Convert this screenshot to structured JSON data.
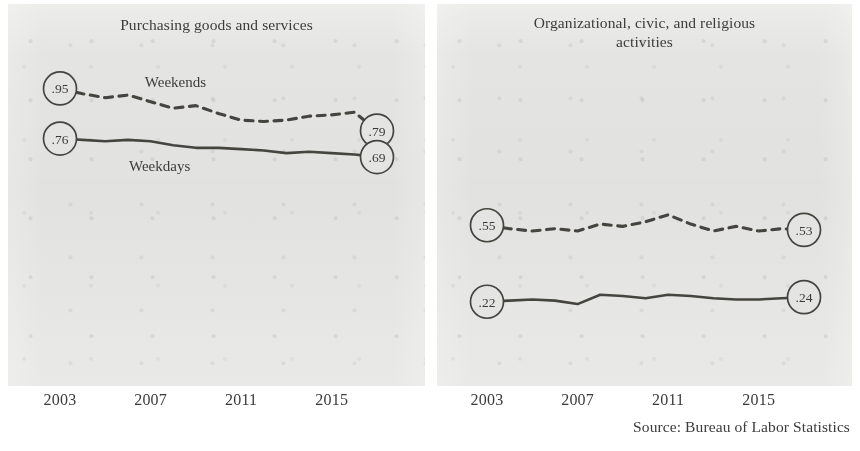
{
  "figure": {
    "width": 860,
    "height": 451,
    "background": "#ffffff",
    "panel_background": "#e4e4e2",
    "ink_color": "#45443f",
    "source_note": "Source: Bureau of Labor Statistics"
  },
  "panels": [
    {
      "id": "purchasing",
      "title": "Purchasing goods and services",
      "tick_labels": [
        "2003",
        "2007",
        "2011",
        "2015"
      ],
      "tick_years": [
        2003,
        2007,
        2011,
        2015
      ],
      "series_labels": [
        {
          "text": "Weekends",
          "year": 2008.1,
          "value": 0.955
        },
        {
          "text": "Weekdays",
          "year": 2007.4,
          "value": 0.638
        }
      ]
    },
    {
      "id": "organizational",
      "title": "Organizational, civic, and religious\nactivities",
      "tick_labels": [
        "2003",
        "2007",
        "2011",
        "2015"
      ],
      "tick_years": [
        2003,
        2007,
        2011,
        2015
      ],
      "series_labels": []
    }
  ],
  "chart_data": [
    {
      "type": "line",
      "title": "Purchasing goods and services",
      "xlabel": "",
      "ylabel": "Hours per day",
      "xlim": [
        2003,
        2017
      ],
      "ylim": [
        0.55,
        1.02
      ],
      "grid": false,
      "legend": "inline-annotations",
      "x": [
        2003,
        2004,
        2005,
        2006,
        2007,
        2008,
        2009,
        2010,
        2011,
        2012,
        2013,
        2014,
        2015,
        2016,
        2017
      ],
      "tick_labels": [
        "2003",
        "2007",
        "2011",
        "2015"
      ],
      "tick_x": [
        2003,
        2007,
        2011,
        2015
      ],
      "series": [
        {
          "name": "Weekends",
          "style": "dashed",
          "values": [
            0.95,
            0.93,
            0.915,
            0.925,
            0.9,
            0.875,
            0.885,
            0.855,
            0.83,
            0.825,
            0.83,
            0.845,
            0.85,
            0.86,
            0.79
          ],
          "endpoint_labels": [
            {
              "position": "start",
              "text": ".95",
              "value": 0.95
            },
            {
              "position": "end",
              "text": ".79",
              "value": 0.79
            }
          ]
        },
        {
          "name": "Weekdays",
          "style": "solid",
          "values": [
            0.76,
            0.755,
            0.75,
            0.755,
            0.75,
            0.735,
            0.725,
            0.725,
            0.72,
            0.715,
            0.705,
            0.71,
            0.705,
            0.7,
            0.69
          ],
          "endpoint_labels": [
            {
              "position": "start",
              "text": ".76",
              "value": 0.76
            },
            {
              "position": "end",
              "text": ".69",
              "value": 0.69
            }
          ]
        }
      ]
    },
    {
      "type": "line",
      "title": "Organizational, civic, and religious activities",
      "xlabel": "",
      "ylabel": "Hours per day",
      "xlim": [
        2003,
        2017
      ],
      "ylim": [
        0.15,
        0.62
      ],
      "grid": false,
      "legend": "inline-annotations",
      "x": [
        2003,
        2004,
        2005,
        2006,
        2007,
        2008,
        2009,
        2010,
        2011,
        2012,
        2013,
        2014,
        2015,
        2016,
        2017
      ],
      "tick_labels": [
        "2003",
        "2007",
        "2011",
        "2015"
      ],
      "tick_x": [
        2003,
        2007,
        2011,
        2015
      ],
      "series": [
        {
          "name": "Weekends",
          "style": "dashed",
          "values": [
            0.55,
            0.535,
            0.525,
            0.535,
            0.525,
            0.555,
            0.545,
            0.565,
            0.595,
            0.555,
            0.525,
            0.545,
            0.525,
            0.535,
            0.53
          ],
          "endpoint_labels": [
            {
              "position": "start",
              "text": ".55",
              "value": 0.55
            },
            {
              "position": "end",
              "text": ".53",
              "value": 0.53
            }
          ]
        },
        {
          "name": "Weekdays",
          "style": "solid",
          "values": [
            0.22,
            0.225,
            0.23,
            0.225,
            0.21,
            0.25,
            0.245,
            0.235,
            0.25,
            0.245,
            0.235,
            0.23,
            0.23,
            0.235,
            0.24
          ],
          "endpoint_labels": [
            {
              "position": "start",
              "text": ".22",
              "value": 0.22
            },
            {
              "position": "end",
              "text": ".24",
              "value": 0.24
            }
          ]
        }
      ]
    }
  ]
}
